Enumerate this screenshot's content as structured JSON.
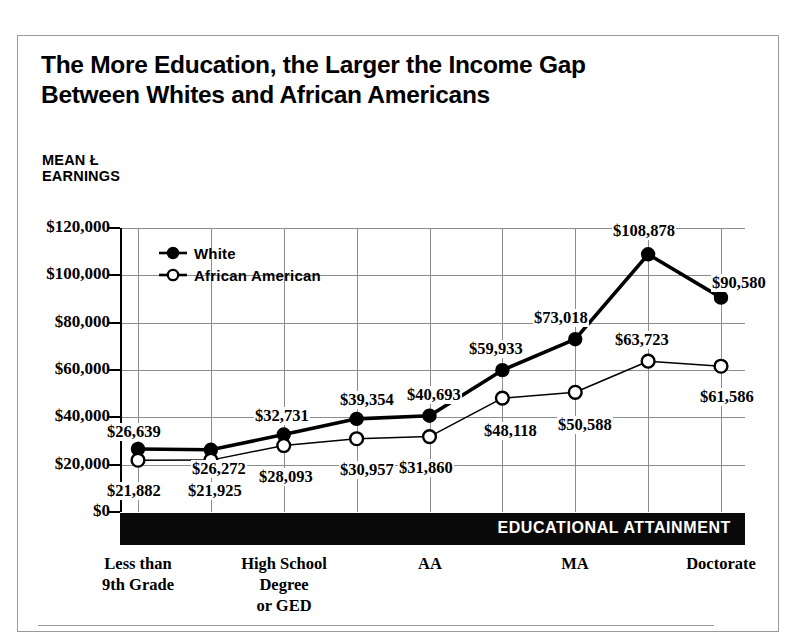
{
  "headline": {
    "line1": "The More Education, the Larger the Income Gap",
    "line2": "Between Whites and African Americans"
  },
  "axis_title": {
    "line1": "MEAN Ł",
    "line2": "EARNINGS"
  },
  "attainment_bar_label": "EDUCATIONAL ATTAINMENT",
  "legend": {
    "white": "White",
    "african_american": "African American"
  },
  "chart_data": {
    "type": "line",
    "title": "The More Education, the Larger the Income Gap Between Whites and African Americans",
    "xlabel": "EDUCATIONAL ATTAINMENT",
    "ylabel": "MEAN Ł EARNINGS",
    "ylim": [
      0,
      120000
    ],
    "yticks": [
      0,
      20000,
      40000,
      60000,
      80000,
      100000,
      120000
    ],
    "ytick_labels": [
      "$0",
      "$20,000",
      "$40,000",
      "$60,000",
      "$80,000",
      "$100,000",
      "$120,000"
    ],
    "grid": true,
    "legend_position": "upper-left-inside",
    "categories": [
      "Less than 9th Grade",
      "",
      "High School Degree or GED",
      "",
      "AA",
      "",
      "MA",
      "",
      "Doctorate"
    ],
    "xtick_labels_shown": [
      {
        "index": 0,
        "lines": [
          "Less than",
          "9th Grade"
        ]
      },
      {
        "index": 2,
        "lines": [
          "High School",
          "Degree",
          "or GED"
        ]
      },
      {
        "index": 4,
        "lines": [
          "AA"
        ]
      },
      {
        "index": 6,
        "lines": [
          "MA"
        ]
      },
      {
        "index": 8,
        "lines": [
          "Doctorate"
        ]
      }
    ],
    "series": [
      {
        "name": "White",
        "marker": "filled-circle",
        "values": [
          26639,
          26272,
          32731,
          39354,
          40693,
          59933,
          73018,
          108878,
          90580
        ],
        "labels": [
          "$26,639",
          "$26,272",
          "$32,731",
          "$39,354",
          "$40,693",
          "$59,933",
          "$73,018",
          "$108,878",
          "$90,580"
        ]
      },
      {
        "name": "African American",
        "marker": "open-circle",
        "values": [
          21882,
          21925,
          28093,
          30957,
          31860,
          48118,
          50588,
          63723,
          61586
        ],
        "labels": [
          "$21,882",
          "$21,925",
          "$28,093",
          "$30,957",
          "$31,860",
          "$48,118",
          "$50,588",
          "$63,723",
          "$61,586"
        ]
      }
    ]
  },
  "colors": {
    "ink": "#000000",
    "grid": "#8d8d8d",
    "frame": "#9a9a9a",
    "bar": "#0a0a0a",
    "paper": "#ffffff"
  }
}
